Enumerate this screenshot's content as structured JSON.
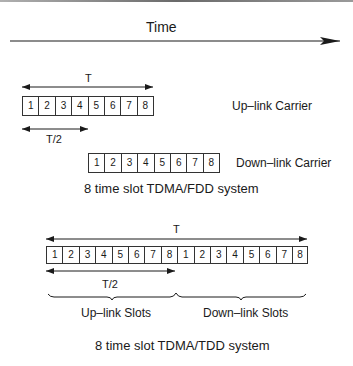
{
  "time_axis": {
    "label": "Time"
  },
  "fdd": {
    "period_label": "T",
    "half_period_label": "T/2",
    "uplink": {
      "label": "Up–link Carrier",
      "slots": [
        "1",
        "2",
        "3",
        "4",
        "5",
        "6",
        "7",
        "8"
      ]
    },
    "downlink": {
      "label": "Down–link Carrier",
      "slots": [
        "1",
        "2",
        "3",
        "4",
        "5",
        "6",
        "7",
        "8"
      ]
    },
    "caption": "8 time slot TDMA/FDD system"
  },
  "tdd": {
    "period_label": "T",
    "half_period_label": "T/2",
    "slots": [
      "1",
      "2",
      "3",
      "4",
      "5",
      "6",
      "7",
      "8",
      "1",
      "2",
      "3",
      "4",
      "5",
      "6",
      "7",
      "8"
    ],
    "uplink_label": "Up–link Slots",
    "downlink_label": "Down–link Slots",
    "caption": "8 time slot TDMA/TDD system"
  },
  "colors": {
    "line": "#1a1a1a",
    "border_top": "#7a7a7a"
  }
}
